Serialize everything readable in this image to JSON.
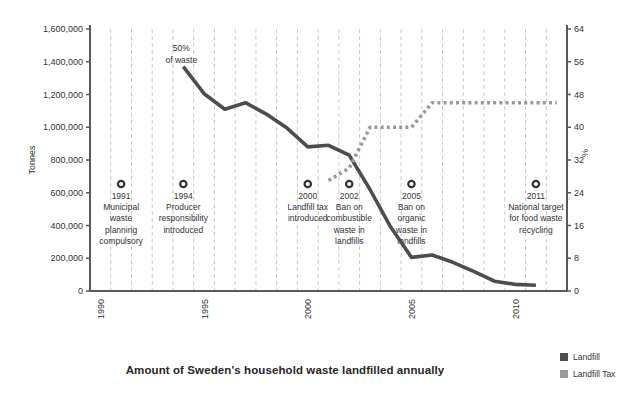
{
  "chart_data": {
    "type": "line",
    "title": "Amount of Sweden's household waste landfilled annually",
    "left_axis": {
      "label": "Tonnes",
      "min": 0,
      "max": 1600000,
      "step": 200000
    },
    "right_axis": {
      "label": "%",
      "min": 0,
      "max": 64,
      "step": 8
    },
    "x_axis": {
      "start_year": 1990,
      "end_year": 2012,
      "labeled_ticks": [
        1990,
        1995,
        2000,
        2005,
        2010
      ],
      "gridlines": "between-years-dashed"
    },
    "series": [
      {
        "name": "Landfill",
        "axis": "left",
        "style": "solid",
        "color": "#4d4d4d",
        "x": [
          1994,
          1995,
          1996,
          1997,
          1998,
          1999,
          2000,
          2001,
          2002,
          2003,
          2004,
          2005,
          2006,
          2007,
          2008,
          2009,
          2010,
          2011
        ],
        "values": [
          1370000,
          1205000,
          1110000,
          1150000,
          1080000,
          995000,
          880000,
          890000,
          830000,
          620000,
          390000,
          205000,
          220000,
          175000,
          120000,
          60000,
          40000,
          35000
        ]
      },
      {
        "name": "Landfill Tax",
        "axis": "right",
        "style": "dotted",
        "color": "#999999",
        "x": [
          2001,
          2002,
          2003,
          2004,
          2005,
          2006,
          2007,
          2008,
          2009,
          2010,
          2011,
          2012
        ],
        "values": [
          27,
          30,
          40,
          40,
          40,
          46,
          46,
          46,
          46,
          46,
          46,
          46
        ]
      }
    ],
    "point_annotation": {
      "year": 1994,
      "lines": [
        "50%",
        "of waste"
      ]
    },
    "event_annotations": [
      {
        "year": 1991,
        "label": "1991",
        "lines": [
          "Municipal",
          "waste",
          "planning",
          "compulsory"
        ]
      },
      {
        "year": 1994,
        "label": "1994",
        "lines": [
          "Producer",
          "responsibility",
          "introduced"
        ]
      },
      {
        "year": 2000,
        "label": "2000",
        "lines": [
          "Landfill tax",
          "introduced"
        ]
      },
      {
        "year": 2002,
        "label": "2002",
        "lines": [
          "Ban on",
          "combustible",
          "waste in",
          "landfills"
        ]
      },
      {
        "year": 2005,
        "label": "2005",
        "lines": [
          "Ban on",
          "organic",
          "waste in",
          "landfills"
        ]
      },
      {
        "year": 2011,
        "label": "2011",
        "lines": [
          "National target",
          "for food waste",
          "recycling"
        ]
      }
    ],
    "legend": [
      {
        "label": "Landfill",
        "color": "#4d4d4d"
      },
      {
        "label": "Landfill Tax",
        "color": "#999999"
      }
    ],
    "colors": {
      "axis": "#595959",
      "gridline": "#c9c9c9",
      "tick_text": "#333333",
      "annotation_text": "#333333",
      "annotation_ring": "#333333",
      "background": "#ffffff"
    }
  }
}
